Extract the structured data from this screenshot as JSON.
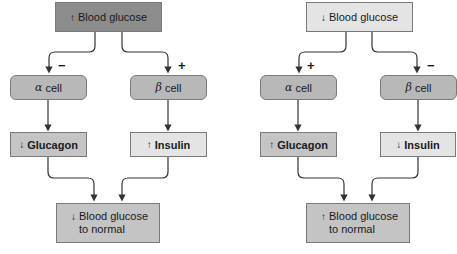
{
  "colors": {
    "dark_box": "#8c8c8c",
    "cell": "#b8b8b8",
    "mid_box": "#c4c4c4",
    "light_box": "#e4e4e4",
    "line": "#333333"
  },
  "left_panel": {
    "top": {
      "arrow": "↑",
      "label": "Blood glucose"
    },
    "alpha": {
      "symbol": "α",
      "label": "cell",
      "sign": "−"
    },
    "beta": {
      "symbol": "β",
      "label": "cell",
      "sign": "+"
    },
    "glucagon": {
      "arrow": "↓",
      "label": "Glucagon"
    },
    "insulin": {
      "arrow": "↑",
      "label": "Insulin"
    },
    "result": {
      "arrow": "↓",
      "line1": "Blood glucose",
      "line2": "to normal"
    }
  },
  "right_panel": {
    "top": {
      "arrow": "↓",
      "label": "Blood glucose"
    },
    "alpha": {
      "symbol": "α",
      "label": "cell",
      "sign": "+"
    },
    "beta": {
      "symbol": "β",
      "label": "cell",
      "sign": "−"
    },
    "glucagon": {
      "arrow": "↑",
      "label": "Glucagon"
    },
    "insulin": {
      "arrow": "↓",
      "label": "Insulin"
    },
    "result": {
      "arrow": "↑",
      "line1": "Blood glucose",
      "line2": "to normal"
    }
  }
}
